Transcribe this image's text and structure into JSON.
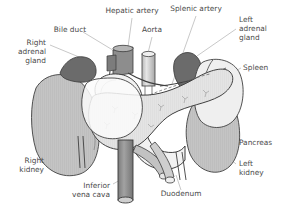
{
  "figure": {
    "width": 287,
    "height": 214,
    "background": "#ffffff"
  },
  "palette": {
    "label_text": "#4a4a4a",
    "leader_line": "#9a9a9a",
    "outline": "#3b3b3b",
    "adrenal_fill": "#6f6f6f",
    "kidney_fill": "#c6c6c6",
    "pancreas_fill": "#e2e2e2",
    "duodenum_fill": "#f0f0f0",
    "spleen_fill": "#ededed",
    "vessel_dark": "#8a8a8a",
    "vessel_light": "#d5d5d5",
    "ivc_fill": "#989898"
  },
  "labels": [
    {
      "id": "hepatic-artery",
      "text": "Hepatic artery",
      "lines": [
        "Hepatic artery"
      ],
      "x": 132,
      "y": 13,
      "anchor": "middle"
    },
    {
      "id": "splenic-artery",
      "text": "Splenic artery",
      "lines": [
        "Splenic artery"
      ],
      "x": 196,
      "y": 11,
      "anchor": "middle"
    },
    {
      "id": "bile-duct",
      "text": "Bile duct",
      "lines": [
        "Bile duct"
      ],
      "x": 70,
      "y": 32,
      "anchor": "middle"
    },
    {
      "id": "aorta",
      "text": "Aorta",
      "lines": [
        "Aorta"
      ],
      "x": 152,
      "y": 32,
      "anchor": "middle"
    },
    {
      "id": "left-adrenal-gland",
      "text": "Left adrenal gland",
      "lines": [
        "Left",
        "adrenal",
        "gland"
      ],
      "x": 239,
      "y": 22,
      "anchor": "start"
    },
    {
      "id": "right-adrenal-gland",
      "text": "Right adrenal gland",
      "lines": [
        "Right",
        "adrenal",
        "gland"
      ],
      "x": 46,
      "y": 45,
      "anchor": "end"
    },
    {
      "id": "spleen",
      "text": "Spleen",
      "lines": [
        "Spleen"
      ],
      "x": 243,
      "y": 70,
      "anchor": "start"
    },
    {
      "id": "pancreas",
      "text": "Pancreas",
      "lines": [
        "Pancreas"
      ],
      "x": 239,
      "y": 145,
      "anchor": "start"
    },
    {
      "id": "right-kidney",
      "text": "Right kidney",
      "lines": [
        "Right",
        "kidney"
      ],
      "x": 44,
      "y": 163,
      "anchor": "end"
    },
    {
      "id": "left-kidney",
      "text": "Left kidney",
      "lines": [
        "Left",
        "kidney"
      ],
      "x": 239,
      "y": 166,
      "anchor": "start"
    },
    {
      "id": "inferior-vena-cava",
      "text": "Inferior vena cava",
      "lines": [
        "Inferior",
        "vena cava"
      ],
      "x": 110,
      "y": 188,
      "anchor": "end"
    },
    {
      "id": "duodenum",
      "text": "Duodenum",
      "lines": [
        "Duodenum"
      ],
      "x": 181,
      "y": 196,
      "anchor": "middle"
    }
  ],
  "structures": [
    {
      "id": "right-adrenal-gland",
      "name": "Right adrenal gland",
      "fill": "#6f6f6f"
    },
    {
      "id": "left-adrenal-gland",
      "name": "Left adrenal gland",
      "fill": "#6f6f6f"
    },
    {
      "id": "right-kidney",
      "name": "Right kidney",
      "fill": "#c6c6c6"
    },
    {
      "id": "left-kidney",
      "name": "Left kidney",
      "fill": "#c6c6c6"
    },
    {
      "id": "spleen",
      "name": "Spleen",
      "fill": "#ededed"
    },
    {
      "id": "pancreas",
      "name": "Pancreas",
      "fill": "#e2e2e2"
    },
    {
      "id": "duodenum",
      "name": "Duodenum",
      "fill": "#f0f0f0"
    },
    {
      "id": "aorta",
      "name": "Aorta",
      "fill": "#d5d5d5"
    },
    {
      "id": "inferior-vena-cava",
      "name": "Inferior vena cava",
      "fill": "#989898"
    },
    {
      "id": "hepatic-artery",
      "name": "Hepatic artery",
      "fill": "#8a8a8a"
    },
    {
      "id": "splenic-artery",
      "name": "Splenic artery",
      "fill": "#8a8a8a"
    },
    {
      "id": "bile-duct",
      "name": "Bile duct",
      "fill": "#8a8a8a"
    }
  ]
}
